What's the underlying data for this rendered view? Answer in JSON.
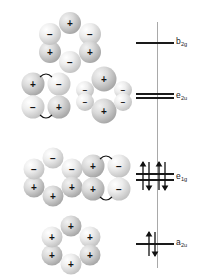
{
  "figure": {
    "axis_color": "#a9a9a9",
    "level_color": "#1a1a1a",
    "lobe_color": "#d8d8d8",
    "sign_plus": "+",
    "sign_minus": "−"
  },
  "axis": {
    "name": "energy-axis",
    "top_y": 22,
    "bottom_y": 268,
    "x": 157
  },
  "levels": [
    {
      "id": "b2g",
      "label_main": "b",
      "label_sub": "2g",
      "label_text": "b2g",
      "y": 42,
      "lines": 1,
      "electrons": 0,
      "occupancy": "empty",
      "character": "antibonding"
    },
    {
      "id": "e2u",
      "label_main": "e",
      "label_sub": "2u",
      "label_text": "e2u",
      "y": 96,
      "lines": 2,
      "electrons": 0,
      "occupancy": "empty",
      "character": "antibonding"
    },
    {
      "id": "e1g",
      "label_main": "e",
      "label_sub": "1g",
      "label_text": "e1g",
      "y": 176,
      "lines": 2,
      "electrons": 4,
      "occupancy": "filled",
      "character": "bonding"
    },
    {
      "id": "a2u",
      "label_main": "a",
      "label_sub": "2u",
      "label_text": "a2u",
      "y": 243,
      "lines": 1,
      "electrons": 2,
      "occupancy": "filled",
      "character": "bonding"
    }
  ],
  "orbitals": [
    {
      "id": "b2g-orbital",
      "level": "b2g",
      "shape": "hexagon-ring",
      "description": "six lobes in a ring with alternating signs",
      "signs": [
        "+",
        "−",
        "−",
        "+",
        "+",
        "−"
      ],
      "nodes": 3
    },
    {
      "id": "e2u-orbital-left",
      "level": "e2u",
      "shape": "four-lobe-square",
      "description": "four lobes with horizontal nodal arcs top and bottom",
      "signs": [
        "+",
        "−",
        "−",
        "+"
      ],
      "nodes": 2
    },
    {
      "id": "e2u-orbital-right",
      "level": "e2u",
      "shape": "two-large-four-small",
      "description": "large plus lobes top and bottom, four small minus lobes at sides",
      "signs": [
        "+",
        "−",
        "−",
        "−",
        "−",
        "+"
      ],
      "nodes": 2
    },
    {
      "id": "e1g-orbital-left",
      "level": "e1g",
      "shape": "hexagon-ring-split",
      "description": "ring with three minus lobes on top and three plus lobes below",
      "signs": [
        "−",
        "−",
        "−",
        "+",
        "+",
        "+"
      ],
      "nodes": 1
    },
    {
      "id": "e1g-orbital-right",
      "level": "e1g",
      "shape": "four-lobe-square",
      "description": "plus lobes on the left, minus lobes on the right, vertical nodal arcs",
      "signs": [
        "+",
        "−",
        "+",
        "−"
      ],
      "nodes": 1
    },
    {
      "id": "a2u-orbital",
      "level": "a2u",
      "shape": "hexagon-ring",
      "description": "six lobes in a ring all with the same plus sign, fully bonding",
      "signs": [
        "+",
        "+",
        "+",
        "+",
        "+",
        "+"
      ],
      "nodes": 0
    }
  ]
}
